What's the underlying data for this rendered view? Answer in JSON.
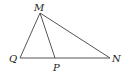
{
  "diagram": {
    "type": "geometry-triangle",
    "points": {
      "M": {
        "label": "M",
        "x": 40,
        "y": 13
      },
      "Q": {
        "label": "Q",
        "x": 20,
        "y": 58
      },
      "P": {
        "label": "P",
        "x": 55,
        "y": 58
      },
      "N": {
        "label": "N",
        "x": 110,
        "y": 58
      }
    },
    "segments": [
      {
        "from": "M",
        "to": "Q"
      },
      {
        "from": "M",
        "to": "P"
      },
      {
        "from": "M",
        "to": "N"
      },
      {
        "from": "Q",
        "to": "N"
      }
    ],
    "colors": {
      "line": "#555555",
      "label": "#222222",
      "background": "#ffffff"
    }
  }
}
